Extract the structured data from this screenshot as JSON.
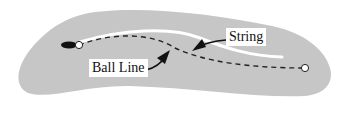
{
  "diagram": {
    "type": "putting-green-ball-line",
    "labels": {
      "string": "String",
      "ball_line": "Ball Line"
    },
    "colors": {
      "green": "#c6c6c6",
      "string": "#ffffff",
      "ball_line": "#222222",
      "arrow": "#111111",
      "background": "#ffffff"
    },
    "elements": {
      "ball": {
        "shape": "elongated-dark-blob",
        "position": "left"
      },
      "start_marker": {
        "shape": "open-circle",
        "position": "left"
      },
      "end_marker": {
        "shape": "open-circle",
        "position": "right (hole)"
      }
    }
  }
}
